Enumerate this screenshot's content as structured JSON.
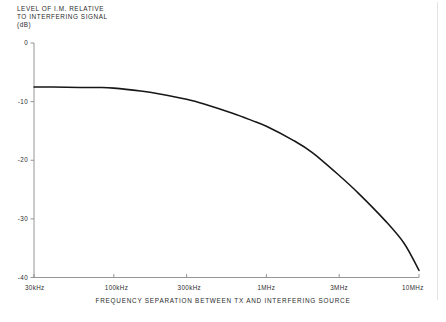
{
  "figure": {
    "y_axis_caption_lines": [
      "LEVEL OF I.M. RELATIVE",
      "TO INTERFERING SIGNAL",
      "(dB)"
    ],
    "x_axis_title": "FREQUENCY SEPARATION BETWEEN TX AND INTERFERING SOURCE",
    "curve_color": "#161616",
    "axis_color": "#8a8a8a",
    "background_color": "#ffffff",
    "footer_artifact": ""
  },
  "chart_data": {
    "type": "line",
    "title": "",
    "subtitle": "",
    "xlabel": "FREQUENCY SEPARATION BETWEEN TX AND INTERFERING SOURCE",
    "ylabel": "LEVEL OF I.M. RELATIVE TO INTERFERING SIGNAL (dB)",
    "xscale": "log",
    "yscale": "linear",
    "xlim": [
      30,
      10000
    ],
    "ylim": [
      -40,
      0
    ],
    "x_unit": "kHz",
    "xticks": [
      30,
      100,
      300,
      1000,
      3000,
      10000
    ],
    "xtick_labels": [
      "30kHz",
      "100kHz",
      "300kHz",
      "1MHz",
      "3MHz",
      "10MHz"
    ],
    "yticks": [
      0,
      -10,
      -20,
      -30,
      -40
    ],
    "ytick_labels": [
      "0",
      "-10",
      "-20",
      "-30",
      "-40"
    ],
    "grid": false,
    "legend": null,
    "series": [
      {
        "name": "Intermodulation level",
        "x": [
          30,
          40,
          60,
          80,
          100,
          150,
          200,
          300,
          400,
          600,
          800,
          1000,
          1500,
          2000,
          3000,
          4000,
          6000,
          8000,
          10000
        ],
        "values": [
          -7.5,
          -7.5,
          -7.6,
          -7.6,
          -7.7,
          -8.2,
          -8.7,
          -9.6,
          -10.5,
          -12.0,
          -13.2,
          -14.2,
          -16.6,
          -18.7,
          -22.6,
          -25.6,
          -30.3,
          -34.2,
          -38.8
        ]
      }
    ],
    "annotations": []
  }
}
